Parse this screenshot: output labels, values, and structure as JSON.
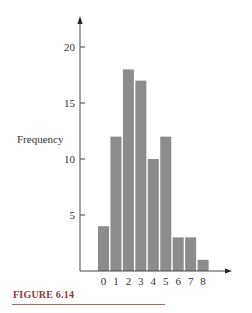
{
  "chart_data": {
    "type": "bar",
    "title": "",
    "xlabel": "",
    "ylabel": "Frequency",
    "categories": [
      "0",
      "1",
      "2",
      "3",
      "4",
      "5",
      "6",
      "7",
      "8"
    ],
    "values": [
      4,
      12,
      18,
      17,
      10,
      12,
      3,
      3,
      1
    ],
    "yticks": [
      5,
      10,
      15,
      20
    ],
    "ylim": [
      0,
      22
    ],
    "grid": false,
    "legend": null,
    "bar_color": "#8c8c8c"
  },
  "figure": {
    "caption": "FIGURE 6.14",
    "caption_color": "#8a3b35"
  }
}
